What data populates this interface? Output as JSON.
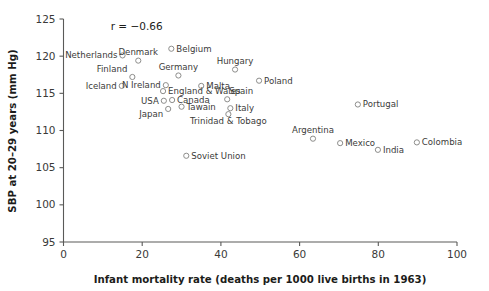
{
  "chart_data": {
    "type": "scatter",
    "title": "",
    "xlabel": "Infant mortality rate (deaths per 1000 live births in 1963)",
    "ylabel": "SBP at 20–29 years (mm Hg)",
    "xlim": [
      0,
      100
    ],
    "ylim": [
      95,
      125
    ],
    "xticks": [
      0,
      20,
      40,
      60,
      80,
      100
    ],
    "yticks": [
      95,
      100,
      105,
      110,
      115,
      120,
      125
    ],
    "grid": false,
    "legend": "none",
    "annotations": [
      {
        "text": "r = −0.66",
        "x": 12,
        "y": 123.5
      }
    ],
    "points": [
      {
        "label": "Netherlands",
        "x": 15.0,
        "y": 120.1,
        "label_pos": "left"
      },
      {
        "label": "Denmark",
        "x": 19.0,
        "y": 119.4,
        "label_pos": "above"
      },
      {
        "label": "Belgium",
        "x": 27.4,
        "y": 121.0,
        "label_pos": "right"
      },
      {
        "label": "Finland",
        "x": 17.5,
        "y": 117.2,
        "label_pos": "above-left"
      },
      {
        "label": "Iceland",
        "x": 14.8,
        "y": 116.0,
        "label_pos": "left"
      },
      {
        "label": "Germany",
        "x": 29.2,
        "y": 117.4,
        "label_pos": "above"
      },
      {
        "label": "N Ireland",
        "x": 26.0,
        "y": 116.1,
        "label_pos": "left"
      },
      {
        "label": "England & Wales",
        "x": 25.3,
        "y": 115.3,
        "label_pos": "right"
      },
      {
        "label": "USA",
        "x": 25.5,
        "y": 114.0,
        "label_pos": "left"
      },
      {
        "label": "Canada",
        "x": 27.6,
        "y": 114.1,
        "label_pos": "right"
      },
      {
        "label": "Japan",
        "x": 26.6,
        "y": 112.9,
        "label_pos": "below-left"
      },
      {
        "label": "Tawain",
        "x": 30.0,
        "y": 113.2,
        "label_pos": "right"
      },
      {
        "label": "Malta",
        "x": 35.0,
        "y": 116.0,
        "label_pos": "right"
      },
      {
        "label": "Hungary",
        "x": 43.6,
        "y": 118.2,
        "label_pos": "above"
      },
      {
        "label": "Poland",
        "x": 49.7,
        "y": 116.7,
        "label_pos": "right"
      },
      {
        "label": "Spain",
        "x": 41.6,
        "y": 114.2,
        "label_pos": "above-right"
      },
      {
        "label": "Italy",
        "x": 42.4,
        "y": 113.0,
        "label_pos": "right"
      },
      {
        "label": "Trinidad & Tobago",
        "x": 41.9,
        "y": 112.2,
        "label_pos": "below"
      },
      {
        "label": "Portugal",
        "x": 74.8,
        "y": 113.5,
        "label_pos": "right"
      },
      {
        "label": "Argentina",
        "x": 63.4,
        "y": 108.9,
        "label_pos": "above"
      },
      {
        "label": "Mexico",
        "x": 70.3,
        "y": 108.3,
        "label_pos": "right"
      },
      {
        "label": "India",
        "x": 79.9,
        "y": 107.4,
        "label_pos": "right"
      },
      {
        "label": "Colombia",
        "x": 89.8,
        "y": 108.4,
        "label_pos": "right"
      },
      {
        "label": "Soviet Union",
        "x": 31.2,
        "y": 106.6,
        "label_pos": "right"
      }
    ]
  }
}
